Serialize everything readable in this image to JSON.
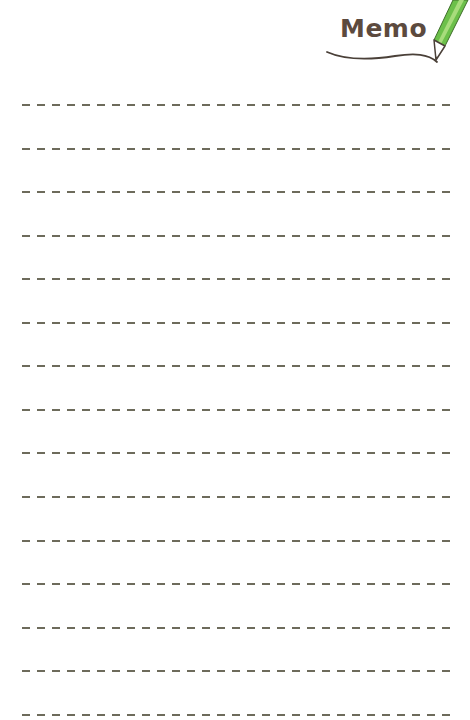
{
  "header": {
    "title": "Memo",
    "icon": "pencil-icon",
    "title_color": "#5c4a3e",
    "pencil_color": "#6cc04a"
  },
  "lines": {
    "count": 15,
    "style": "dashed",
    "color": "#6d6b5b",
    "positions_y": [
      104,
      148,
      191,
      235,
      278,
      322,
      365,
      409,
      452,
      496,
      540,
      583,
      627,
      670,
      714
    ]
  }
}
